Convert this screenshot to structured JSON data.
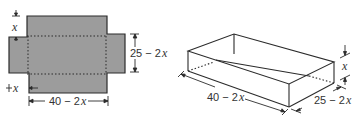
{
  "colors": {
    "flat_fill": "#9c9c9c",
    "stroke": "#2b2b2b",
    "text": "#333333",
    "background": "#ffffff"
  },
  "net": {
    "cut_square_label": "x",
    "corner_label": "x",
    "width_label_const": "25 − 2",
    "width_label_var": "x",
    "length_label_const": "40 − 2",
    "length_label_var": "x"
  },
  "box": {
    "height_label": "x",
    "length_label_const": "40 − 2",
    "length_label_var": "x",
    "width_label_const": "25 − 2",
    "width_label_var": "x"
  }
}
